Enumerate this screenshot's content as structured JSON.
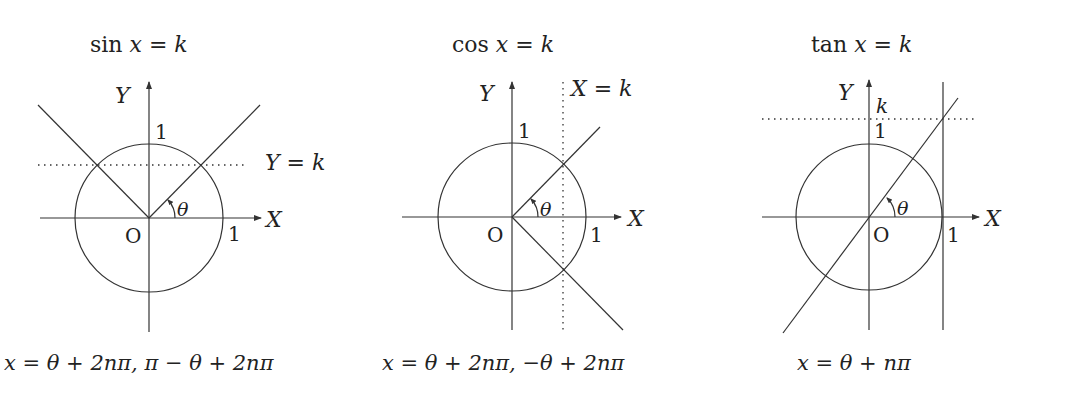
{
  "diagrams": [
    {
      "id": "sin",
      "title": "sin x = k",
      "title_fn": "sin",
      "title_var": "x",
      "title_rest": " = ",
      "title_k": "k",
      "axis_x_label": "X",
      "axis_y_label": "Y",
      "origin_label": "O",
      "unit_x_label": "1",
      "unit_y_label": "1",
      "angle_label": "θ",
      "line_label": "Y = k",
      "line_label_var": "Y",
      "line_label_eq": " = ",
      "line_label_k": "k",
      "solution": "x = θ + 2nπ,  π − θ + 2nπ"
    },
    {
      "id": "cos",
      "title": "cos x = k",
      "title_fn": "cos",
      "title_var": "x",
      "title_rest": " = ",
      "title_k": "k",
      "axis_x_label": "X",
      "axis_y_label": "Y",
      "origin_label": "O",
      "unit_x_label": "1",
      "unit_y_label": "1",
      "angle_label": "θ",
      "line_label": "X = k",
      "line_label_var": "X",
      "line_label_eq": " = ",
      "line_label_k": "k",
      "solution": "x = θ + 2nπ,  −θ + 2nπ"
    },
    {
      "id": "tan",
      "title": "tan x = k",
      "title_fn": "tan",
      "title_var": "x",
      "title_rest": " = ",
      "title_k": "k",
      "axis_x_label": "X",
      "axis_y_label": "Y",
      "origin_label": "O",
      "unit_x_label": "1",
      "unit_y_label": "1",
      "angle_label": "θ",
      "k_label": "k",
      "solution": "x = θ + nπ"
    }
  ]
}
